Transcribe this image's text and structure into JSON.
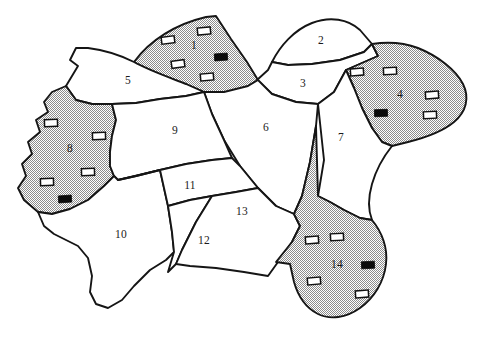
{
  "figure": {
    "type": "region-map",
    "title": "",
    "background_color": "#ffffff",
    "outline_color": "#151515",
    "shaded_fill": "50% dither gray",
    "shaded_color": "#c9c9c9",
    "plain_color": "#ffffff"
  },
  "legend_symbols": {
    "open_rectangle": {
      "name": "open-rectangle-symbol",
      "fill": "#ffffff",
      "stroke": "#101010",
      "width": 13,
      "height": 7
    },
    "filled_rectangle": {
      "name": "filled-rectangle-symbol",
      "fill": "#0a0a0a",
      "stroke": "#0a0a0a",
      "width": 13,
      "height": 7
    }
  },
  "regions": [
    {
      "id": 1,
      "label": "1",
      "shaded": true,
      "label_pos": [
        194,
        46
      ],
      "path": "M 134 62 C 150 40 176 24 206 17 L 216 16 L 231 39 L 247 62 L 258 80 L 248 86 C 232 94 214 96 204 92 L 186 84 C 168 77 148 70 134 62 Z",
      "symbols": [
        {
          "type": "open",
          "x": 168,
          "y": 40,
          "rot": -7
        },
        {
          "type": "open",
          "x": 204,
          "y": 31,
          "rot": -6
        },
        {
          "type": "open",
          "x": 178,
          "y": 64,
          "rot": -8
        },
        {
          "type": "open",
          "x": 207,
          "y": 77,
          "rot": -5
        },
        {
          "type": "filled",
          "x": 221,
          "y": 57,
          "rot": -4
        }
      ]
    },
    {
      "id": 2,
      "label": "2",
      "shaded": false,
      "label_pos": [
        321,
        41
      ],
      "path": "M 272 62 C 280 46 294 30 312 23 C 330 16 348 19 360 30 L 372 44 L 364 52 L 340 60 L 312 64 L 288 65 Z",
      "symbols": []
    },
    {
      "id": 3,
      "label": "3",
      "shaded": false,
      "label_pos": [
        303,
        84
      ],
      "path": "M 257 80 L 268 70 L 272 62 L 288 65 L 312 64 L 340 60 L 364 52 L 372 44 L 378 56 L 346 70 L 334 92 L 318 104 L 296 102 L 272 94 Z",
      "symbols": []
    },
    {
      "id": 4,
      "label": "4",
      "shaded": true,
      "label_pos": [
        400,
        95
      ],
      "path": "M 378 56 L 372 44 C 386 42 402 42 418 48 C 438 56 456 70 463 84 C 470 98 466 112 454 122 C 442 132 424 138 408 142 L 392 146 L 382 142 L 372 128 L 362 108 L 354 88 L 346 70 Z",
      "symbols": [
        {
          "type": "open",
          "x": 357,
          "y": 72,
          "rot": -4
        },
        {
          "type": "open",
          "x": 390,
          "y": 71,
          "rot": -3
        },
        {
          "type": "open",
          "x": 432,
          "y": 95,
          "rot": -4
        },
        {
          "type": "open",
          "x": 430,
          "y": 115,
          "rot": -3
        },
        {
          "type": "filled",
          "x": 381,
          "y": 113,
          "rot": -2
        }
      ]
    },
    {
      "id": 5,
      "label": "5",
      "shaded": false,
      "label_pos": [
        128,
        81
      ],
      "path": "M 134 62 C 120 55 104 50 88 48 L 76 48 L 70 60 L 78 66 L 72 76 L 66 86 L 76 100 L 92 104 L 112 104 L 136 103 L 160 99 L 186 96 L 204 92 L 186 84 C 168 77 148 70 134 62 Z",
      "symbols": []
    },
    {
      "id": 6,
      "label": "6",
      "shaded": false,
      "label_pos": [
        266,
        128
      ],
      "path": "M 204 92 L 224 92 L 248 86 L 258 80 L 272 94 L 296 102 L 318 104 L 316 126 L 310 162 L 302 196 L 294 214 L 276 206 L 258 188 L 240 166 L 224 140 L 212 114 Z",
      "symbols": []
    },
    {
      "id": 7,
      "label": "7",
      "shaded": false,
      "label_pos": [
        341,
        138
      ],
      "path": "M 318 104 L 334 92 L 346 70 L 354 88 L 362 108 L 372 128 L 382 142 L 392 146 C 384 156 376 170 372 184 C 368 198 368 210 372 220 L 360 218 L 344 210 L 330 202 L 318 196 L 324 160 Z",
      "symbols": []
    },
    {
      "id": 8,
      "label": "8",
      "shaded": true,
      "label_pos": [
        70,
        149
      ],
      "path": "M 66 86 L 52 92 L 44 102 L 48 112 L 36 120 L 40 132 L 28 142 L 32 154 L 22 164 L 26 176 L 18 188 L 24 200 L 38 212 L 52 214 L 70 209 L 88 200 L 104 186 L 114 176 L 110 166 L 110 152 L 112 136 L 116 120 L 112 104 L 92 104 L 76 100 Z",
      "symbols": [
        {
          "type": "open",
          "x": 51,
          "y": 123,
          "rot": -2
        },
        {
          "type": "open",
          "x": 99,
          "y": 136,
          "rot": -2
        },
        {
          "type": "open",
          "x": 88,
          "y": 172,
          "rot": -2
        },
        {
          "type": "open",
          "x": 47,
          "y": 182,
          "rot": -2
        },
        {
          "type": "filled",
          "x": 65,
          "y": 199,
          "rot": -4
        }
      ]
    },
    {
      "id": 9,
      "label": "9",
      "shaded": false,
      "label_pos": [
        175,
        131
      ],
      "path": "M 112 104 L 136 103 L 160 99 L 186 96 L 204 92 L 212 114 L 224 140 L 232 158 L 212 160 L 186 164 L 160 170 L 136 176 L 118 180 L 114 176 L 110 166 L 110 152 L 112 136 L 116 120 Z",
      "symbols": []
    },
    {
      "id": 10,
      "label": "10",
      "shaded": false,
      "label_pos": [
        121,
        235
      ],
      "path": "M 114 176 L 118 180 L 136 176 L 160 170 L 168 206 L 172 232 L 174 252 L 166 260 L 150 270 L 134 286 L 122 300 L 108 308 L 96 304 L 90 292 L 92 276 L 88 258 L 78 246 L 66 240 L 54 234 L 44 226 L 38 212 L 52 214 L 70 209 L 88 200 L 104 186 Z",
      "symbols": []
    },
    {
      "id": 11,
      "label": "11",
      "shaded": false,
      "label_pos": [
        190,
        186
      ],
      "path": "M 118 180 L 136 176 L 160 170 L 186 164 L 212 160 L 232 158 L 240 166 L 258 188 L 236 192 L 212 196 L 190 200 L 168 206 L 160 170 Z",
      "symbols": []
    },
    {
      "id": 12,
      "label": "12",
      "shaded": false,
      "label_pos": [
        204,
        241
      ],
      "path": "M 168 206 L 190 200 L 212 196 L 196 222 L 182 250 L 176 264 L 168 272 L 174 252 L 172 232 Z",
      "symbols": []
    },
    {
      "id": 13,
      "label": "13",
      "shaded": false,
      "label_pos": [
        242,
        212
      ],
      "path": "M 212 196 L 236 192 L 258 188 L 276 206 L 294 214 L 300 226 L 292 242 L 278 262 L 268 276 L 244 272 L 216 268 L 190 266 L 176 264 L 182 250 L 196 222 Z",
      "symbols": []
    },
    {
      "id": 14,
      "label": "14",
      "shaded": true,
      "label_pos": [
        337,
        265
      ],
      "path": "M 294 214 L 302 196 L 310 162 L 316 126 L 318 196 L 330 202 L 344 210 L 360 218 L 372 220 C 382 232 388 248 386 264 C 384 282 374 298 360 308 C 346 318 330 320 318 314 C 306 308 298 296 294 282 L 290 264 L 276 262 L 292 242 L 300 226 Z",
      "symbols": [
        {
          "type": "open",
          "x": 312,
          "y": 240,
          "rot": -4
        },
        {
          "type": "open",
          "x": 337,
          "y": 237,
          "rot": -3
        },
        {
          "type": "open",
          "x": 314,
          "y": 281,
          "rot": -5
        },
        {
          "type": "open",
          "x": 362,
          "y": 294,
          "rot": -4
        },
        {
          "type": "filled",
          "x": 368,
          "y": 265,
          "rot": -3
        }
      ]
    }
  ],
  "region_labels": [
    "1",
    "2",
    "3",
    "4",
    "5",
    "6",
    "7",
    "8",
    "9",
    "10",
    "11",
    "12",
    "13",
    "14"
  ]
}
